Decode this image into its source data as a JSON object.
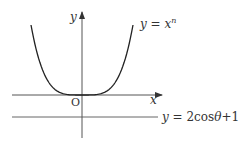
{
  "diagram": {
    "axes": {
      "x_label": "x",
      "y_label": "y",
      "origin_label": "O"
    },
    "curve": {
      "label_lhs": "y",
      "label_eq": " = ",
      "label_base": "x",
      "label_exp": "n"
    },
    "line": {
      "label_lhs": "y",
      "label_eq": " = ",
      "label_rhs_num": "2cos",
      "label_theta": "θ",
      "label_tail": "+1"
    },
    "colors": {
      "curve": "#222222",
      "axes": "#555555",
      "line": "#666666",
      "text": "#333333"
    }
  }
}
